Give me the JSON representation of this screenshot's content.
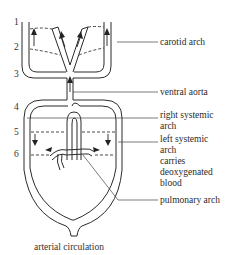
{
  "diagram": {
    "caption": "arterial circulation",
    "arch_numbers": [
      "1",
      "2",
      "3",
      "4",
      "5",
      "6"
    ],
    "labels": {
      "carotid_arch": "carotid arch",
      "ventral_aorta": "ventral aorta",
      "right_systemic_1": "right systemic",
      "right_systemic_2": "arch",
      "left_systemic_1": "left systemic",
      "left_systemic_2": "arch",
      "left_systemic_3": "carries",
      "left_systemic_4": "deoxygenated",
      "left_systemic_5": "blood",
      "pulmonary_arch": "pulmonary arch"
    },
    "colors": {
      "line": "#2b2b2b",
      "text": "#2a2a2a",
      "background": "#ffffff"
    }
  }
}
